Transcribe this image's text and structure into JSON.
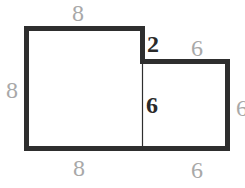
{
  "diagram": {
    "type": "composite-rectilinear-shape",
    "stroke_color": "#2e2e2e",
    "outer_labels": {
      "top_left": "8",
      "left": "8",
      "bottom_left": "8",
      "top_right": "6",
      "right": "6",
      "bottom_right": "6"
    },
    "inner_labels": {
      "step_height": "2",
      "divider_height": "6"
    }
  }
}
